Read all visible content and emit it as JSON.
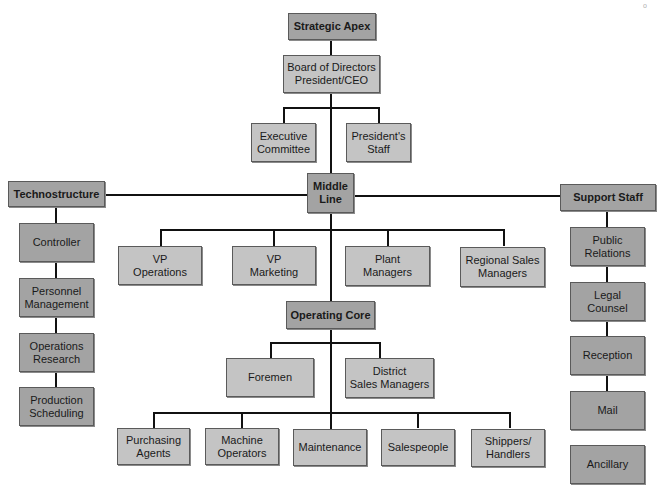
{
  "diagram": {
    "corner_mark": "o",
    "strategic_apex": {
      "header": "Strategic Apex",
      "top": "Board of Directors\nPresident/CEO",
      "children": [
        "Executive\nCommittee",
        "President's\nStaff"
      ]
    },
    "middle_line": {
      "header": "Middle\nLine",
      "children": [
        "VP\nOperations",
        "VP\nMarketing",
        "Plant\nManagers",
        "Regional Sales\nManagers"
      ]
    },
    "technostructure": {
      "header": "Technostructure",
      "items": [
        "Controller",
        "Personnel\nManagement",
        "Operations\nResearch",
        "Production\nScheduling"
      ]
    },
    "support_staff": {
      "header": "Support Staff",
      "items": [
        "Public\nRelations",
        "Legal\nCounsel",
        "Reception",
        "Mail",
        "Ancillary"
      ]
    },
    "operating_core": {
      "header": "Operating Core",
      "middle": [
        "Foremen",
        "District\nSales Managers"
      ],
      "bottom": [
        "Purchasing\nAgents",
        "Machine\nOperators",
        "Maintenance",
        "Salespeople",
        "Shippers/\nHandlers"
      ]
    },
    "colors": {
      "header_box": "#a3a3a3",
      "light_box": "#c4c4c4",
      "dark_box": "#a3a3a3",
      "line": "#111111"
    }
  }
}
